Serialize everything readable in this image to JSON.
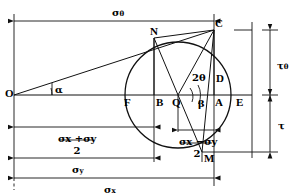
{
  "figure": {
    "line_color": "#111111",
    "background": "#ffffff"
  },
  "points": [
    {
      "key": "O",
      "label": "O",
      "x": 14,
      "y": 95
    },
    {
      "key": "F",
      "label": "F",
      "x": 129,
      "y": 95
    },
    {
      "key": "B",
      "label": "B",
      "x": 154,
      "y": 95
    },
    {
      "key": "Q",
      "label": "Q",
      "x": 178,
      "y": 95
    },
    {
      "key": "A",
      "label": "A",
      "x": 214,
      "y": 95
    },
    {
      "key": "E",
      "label": "E",
      "x": 234,
      "y": 95
    },
    {
      "key": "D",
      "label": "D",
      "x": 214,
      "y": 80
    },
    {
      "key": "C",
      "label": "C",
      "x": 214,
      "y": 30
    },
    {
      "key": "N",
      "label": "N",
      "x": 154,
      "y": 38
    },
    {
      "key": "M",
      "label": "M",
      "x": 202,
      "y": 152
    }
  ],
  "angles": [
    {
      "key": "alpha",
      "label": "α",
      "x": 55,
      "y": 88
    },
    {
      "key": "twotheta",
      "label": "2θ",
      "x": 192,
      "y": 78
    },
    {
      "key": "beta",
      "label": "β",
      "x": 197,
      "y": 104
    }
  ],
  "dimension_labels": {
    "sigma_theta": {
      "base": "σ",
      "subscript": "θ",
      "x": 119,
      "y": 12
    },
    "tau_theta": {
      "base": "τ",
      "subscript": "θ",
      "x": 272,
      "y": 62
    },
    "tau": {
      "base": "τ",
      "subscript": "",
      "x": 272,
      "y": 122
    },
    "sigma_y": {
      "base": "σ",
      "subscript": "y",
      "x": 78,
      "y": 166
    },
    "sigma_x": {
      "base": "σ",
      "subscript": "x",
      "x": 110,
      "y": 182
    }
  },
  "fractions": [
    {
      "key": "sum-over-two",
      "numerator_parts": [
        {
          "base": "σ",
          "subscript": "x"
        },
        {
          "base": "+",
          "subscript": ""
        },
        {
          "base": "σ",
          "subscript": "y"
        }
      ],
      "numerator_text": "σx +σy",
      "denominator": "2",
      "x": 76,
      "y": 137
    },
    {
      "key": "difference-over-two",
      "numerator_parts": [
        {
          "base": "σ",
          "subscript": "x"
        },
        {
          "base": "−",
          "subscript": ""
        },
        {
          "base": "σ",
          "subscript": "y"
        }
      ],
      "numerator_text": "σx −σy",
      "denominator": "2",
      "x": 196,
      "y": 140
    }
  ],
  "circle": {
    "center_x": 178,
    "center_y": 95,
    "radius": 53
  },
  "axis": {
    "baseline_y": 95,
    "left_x": 14,
    "right_x": 252
  }
}
